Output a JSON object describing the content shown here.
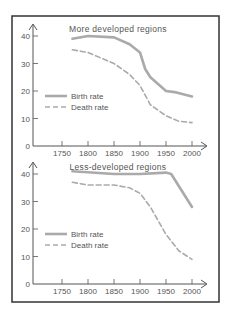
{
  "chart_data": [
    {
      "type": "line",
      "title": "More developed regions",
      "xlabel": "",
      "ylabel": "",
      "xlim": [
        1720,
        2020
      ],
      "ylim": [
        0,
        40
      ],
      "x_ticks": [
        1750,
        1800,
        1850,
        1900,
        1950,
        2000
      ],
      "y_ticks": [
        0,
        10,
        20,
        30,
        40
      ],
      "grid": false,
      "legend_position": "left-middle",
      "series": [
        {
          "name": "Birth rate",
          "style": "solid",
          "x": [
            1770,
            1800,
            1850,
            1880,
            1900,
            1910,
            1920,
            1950,
            1970,
            2000
          ],
          "values": [
            39,
            40,
            39.5,
            37,
            34,
            28,
            25,
            20,
            19.5,
            18
          ]
        },
        {
          "name": "Death rate",
          "style": "dashed",
          "x": [
            1770,
            1800,
            1850,
            1880,
            1900,
            1920,
            1950,
            1975,
            2000
          ],
          "values": [
            35,
            34,
            30,
            26,
            22,
            15,
            11,
            9,
            8.5
          ]
        }
      ]
    },
    {
      "type": "line",
      "title": "Less-developed regions",
      "xlabel": "",
      "ylabel": "",
      "xlim": [
        1720,
        2020
      ],
      "ylim": [
        0,
        40
      ],
      "x_ticks": [
        1750,
        1800,
        1850,
        1900,
        1950,
        2000
      ],
      "y_ticks": [
        0,
        10,
        20,
        30,
        40
      ],
      "grid": false,
      "legend_position": "left-middle",
      "series": [
        {
          "name": "Birth rate",
          "style": "solid",
          "x": [
            1770,
            1850,
            1900,
            1950,
            1960,
            2000
          ],
          "values": [
            41,
            40,
            40,
            40.5,
            40,
            28
          ]
        },
        {
          "name": "Death rate",
          "style": "dashed",
          "x": [
            1770,
            1800,
            1850,
            1880,
            1900,
            1920,
            1950,
            1975,
            2000
          ],
          "values": [
            37,
            36,
            36,
            35,
            33,
            28,
            18,
            12,
            9
          ]
        }
      ]
    }
  ],
  "charts": [
    {
      "title": "More developed regions",
      "legend": {
        "birth": "Birth rate",
        "death": "Death rate"
      },
      "y_labels": [
        "40",
        "30",
        "20",
        "10",
        "0"
      ],
      "x_labels": [
        "1750",
        "1800",
        "1850",
        "1900",
        "1950",
        "2000"
      ]
    },
    {
      "title": "Less-developed regions",
      "legend": {
        "birth": "Birth rate",
        "death": "Death rate"
      },
      "y_labels": [
        "40",
        "30",
        "20",
        "10",
        "0"
      ],
      "x_labels": [
        "1750",
        "1800",
        "1850",
        "1900",
        "1950",
        "2000"
      ]
    }
  ],
  "colors": {
    "frame": "#333333",
    "axis": "#555555",
    "birth": "#aaaaaa",
    "death": "#aaaaaa",
    "text": "#555555"
  }
}
